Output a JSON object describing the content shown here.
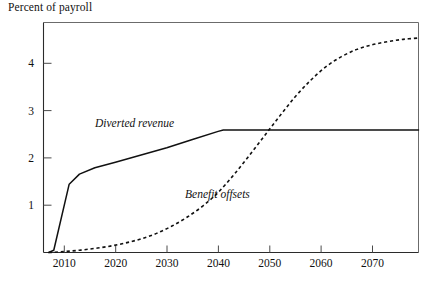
{
  "chart_data": {
    "type": "line",
    "title": "Percent of payroll",
    "xlabel": "",
    "ylabel": "",
    "xlim": [
      2006,
      2079
    ],
    "ylim": [
      0,
      5.05
    ],
    "grid": false,
    "legend_position": "inline-annotations",
    "xticks": [
      2010,
      2020,
      2030,
      2040,
      2050,
      2060,
      2070
    ],
    "xtick_labels": [
      "2010",
      "2020",
      "2030",
      "2040",
      "2050",
      "2060",
      "2070"
    ],
    "yticks": [
      1,
      2,
      3,
      4
    ],
    "ytick_labels": [
      "1",
      "2",
      "3",
      "4"
    ],
    "series": [
      {
        "name": "Diverted revenue",
        "style": "solid",
        "color": "#111111",
        "label_text": "Diverted revenue",
        "x": [
          2007,
          2008,
          2011,
          2013,
          2016,
          2020,
          2025,
          2030,
          2035,
          2040,
          2041,
          2045,
          2050,
          2055,
          2060,
          2065,
          2070,
          2075,
          2079
        ],
        "values": [
          0.0,
          0.05,
          1.5,
          1.72,
          1.86,
          1.98,
          2.14,
          2.3,
          2.48,
          2.66,
          2.69,
          2.69,
          2.69,
          2.69,
          2.69,
          2.69,
          2.69,
          2.69,
          2.69
        ]
      },
      {
        "name": "Benefit offsets",
        "style": "dashed",
        "color": "#111111",
        "label_text": "Benefit offsets",
        "x": [
          2007,
          2010,
          2013,
          2016,
          2019,
          2022,
          2025,
          2028,
          2031,
          2034,
          2037,
          2040,
          2043,
          2046,
          2049,
          2052,
          2055,
          2058,
          2061,
          2064,
          2067,
          2070,
          2073,
          2076,
          2079
        ],
        "values": [
          0.0,
          0.02,
          0.05,
          0.09,
          0.14,
          0.21,
          0.3,
          0.42,
          0.58,
          0.78,
          1.02,
          1.32,
          1.7,
          2.12,
          2.56,
          3.0,
          3.42,
          3.78,
          4.08,
          4.3,
          4.46,
          4.56,
          4.63,
          4.68,
          4.71
        ]
      }
    ],
    "annotations": [
      {
        "text": "Diverted revenue",
        "x": 2021,
        "y": 2.95
      },
      {
        "text": "Benefit offsets",
        "x": 2039,
        "y": 1.22
      }
    ]
  },
  "axes": {
    "frame_color": "#3a3a3a"
  }
}
